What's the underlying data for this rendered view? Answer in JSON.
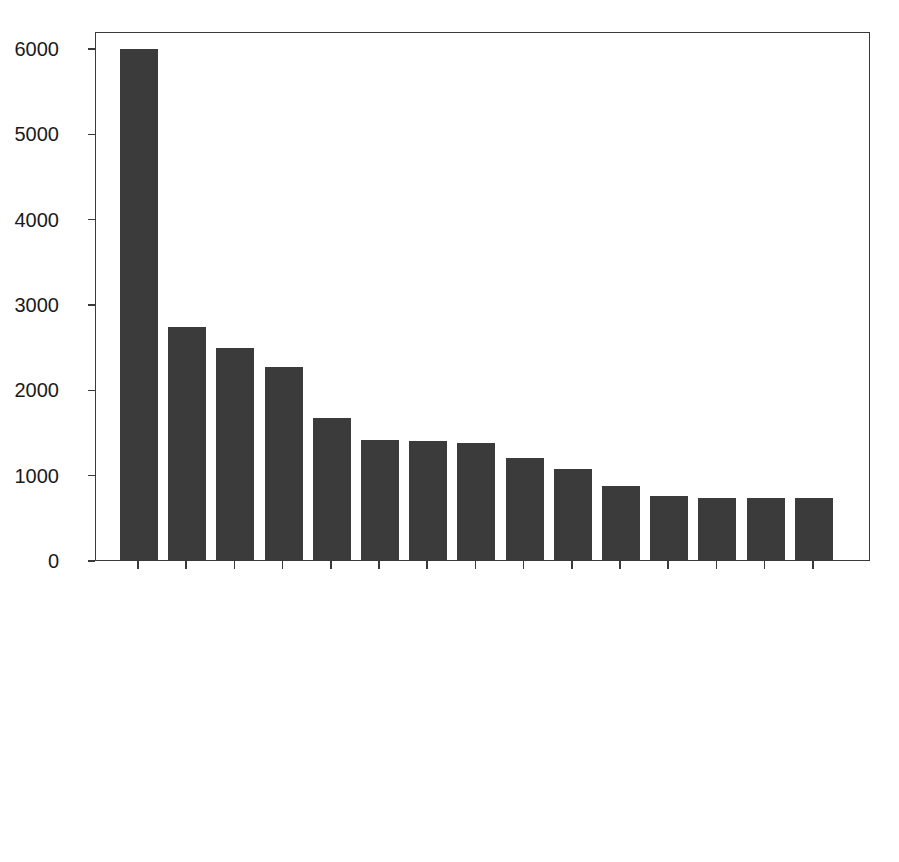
{
  "chart_data": {
    "type": "bar",
    "title": "",
    "subtitle": "",
    "xlabel": "",
    "ylabel": "",
    "grid": false,
    "legend": "none",
    "ylim": [
      0,
      6200
    ],
    "yticks": [
      0,
      1000,
      2000,
      3000,
      4000,
      5000,
      6000
    ],
    "ytick_labels": [
      "0",
      "1000",
      "2000",
      "3000",
      "4000",
      "5000",
      "6000"
    ],
    "categories": [
      "Infiltration",
      "Atelectasis",
      "Effusion",
      "",
      "Nodule",
      "Pneumothorax",
      "Effusion|Infiltration",
      "Mass",
      "Atelectasis|Infiltration",
      "Atelectasis|Effusion",
      "Consolidation",
      "Pleural_Thickening",
      "Atelectasis|Effusion|Infiltration",
      "Infiltration|Nodule",
      "Chardiomegaly"
    ],
    "values": [
      5985,
      2730,
      2480,
      2262,
      1670,
      1412,
      1390,
      1370,
      1190,
      1063,
      865,
      745,
      725,
      725,
      725
    ],
    "bar_color": "#3b3b3b",
    "axis_color": "#3a3a3a",
    "background_color": "#ffffff"
  },
  "figure": {
    "axes_frame": "rectangle",
    "tick_direction": "out"
  }
}
